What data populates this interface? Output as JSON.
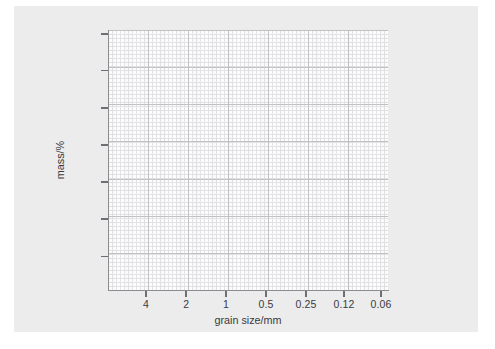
{
  "figure": {
    "paper_color": "#ececed",
    "plot_background": "#fdfdfd",
    "grid_minor_color": "#e3e3e6",
    "grid_major_color": "#c2c2c6",
    "axis_color": "#8b8b90",
    "text_color": "#3a3a3e"
  },
  "chart_data": {
    "type": "line",
    "title": "",
    "subtitle": "",
    "xlabel": "grain size/mm",
    "ylabel": "mass/%",
    "x_tick_labels": [
      "4",
      "2",
      "1",
      "0.5",
      "0.25",
      "0.12",
      "0.06"
    ],
    "x_scale": "log-descending",
    "y_tick_labels": [
      "",
      "",
      "",
      "",
      "",
      "",
      ""
    ],
    "series": [],
    "values": [],
    "categories": [],
    "grid": "major-and-minor",
    "legend": "none",
    "annotations": [],
    "note": "empty grain size distribution grid; no data plotted"
  },
  "axes": {
    "x_ticks": [
      {
        "label": "4",
        "pos_pct": 13.6
      },
      {
        "label": "2",
        "pos_pct": 27.9
      },
      {
        "label": "1",
        "pos_pct": 42.1
      },
      {
        "label": "0.5",
        "pos_pct": 56.4
      },
      {
        "label": "0.25",
        "pos_pct": 70.7
      },
      {
        "label": "0.12",
        "pos_pct": 84.3
      },
      {
        "label": "0.06",
        "pos_pct": 97.5
      }
    ],
    "y_ticks": [
      {
        "label": "",
        "pos_pct": 1.5
      },
      {
        "label": "",
        "pos_pct": 15.7
      },
      {
        "label": "",
        "pos_pct": 30.0
      },
      {
        "label": "",
        "pos_pct": 44.2
      },
      {
        "label": "",
        "pos_pct": 58.5
      },
      {
        "label": "",
        "pos_pct": 72.7
      },
      {
        "label": "",
        "pos_pct": 87.0
      }
    ]
  }
}
